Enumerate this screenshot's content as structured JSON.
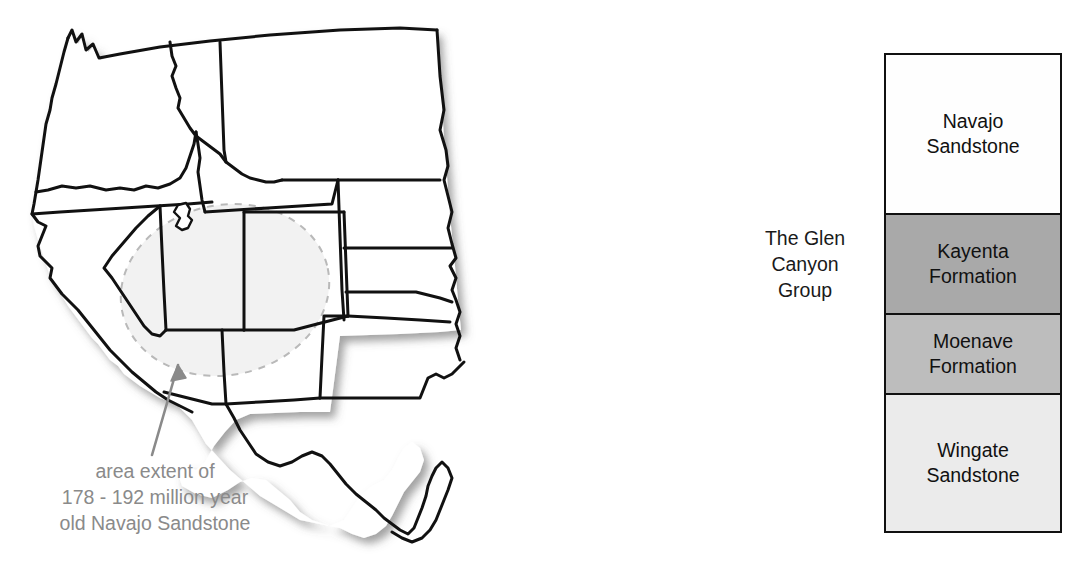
{
  "map": {
    "caption": "area extent of\n178 - 192 million year\nold Navajo Sandstone",
    "caption_color": "#8a8a8a",
    "extent_region_label": "Navajo Sandstone area extent",
    "extent_outline_style": "dashed",
    "extent_fill_color": "#f2f2f2",
    "extent_outline_color": "#b9b9b9",
    "arrow_color": "#8a8a8a",
    "state_outline_color": "#111111",
    "state_fill_color": "#ffffff",
    "states": [
      "Washington",
      "Oregon",
      "California",
      "Nevada",
      "Idaho",
      "Montana",
      "Wyoming",
      "Utah",
      "Arizona",
      "Colorado",
      "New Mexico",
      "North Dakota",
      "South Dakota",
      "Nebraska",
      "Kansas",
      "Oklahoma",
      "Texas"
    ]
  },
  "stratigraphy": {
    "group_label": "The Glen\nCanyon\nGroup",
    "border_color": "#111111",
    "units": [
      {
        "name": "Navajo Sandstone",
        "label": "Navajo\nSandstone",
        "fill": "#fefefe"
      },
      {
        "name": "Kayenta Formation",
        "label": "Kayenta\nFormation",
        "fill": "#a9a9a9"
      },
      {
        "name": "Moenave Formation",
        "label": "Moenave\nFormation",
        "fill": "#bdbdbd"
      },
      {
        "name": "Wingate Sandstone",
        "label": "Wingate\nSandstone",
        "fill": "#ebebeb"
      }
    ]
  }
}
